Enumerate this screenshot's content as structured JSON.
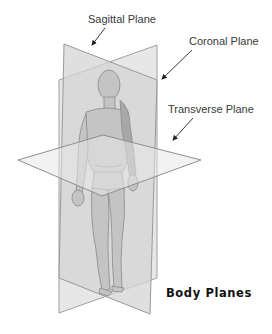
{
  "diagram": {
    "title": "Body Planes",
    "labels": {
      "sagittal": "Sagittal Plane",
      "coronal": "Coronal Plane",
      "transverse": "Transverse Plane"
    },
    "colors": {
      "background": "#ffffff",
      "plane_fill": "#d9d9d9",
      "plane_stroke": "#9a9a9a",
      "figure_fill": "#bdbdbd",
      "figure_stroke": "#8a8a8a",
      "text": "#3a3a3a",
      "title": "#111111",
      "arrow": "#222222"
    }
  }
}
